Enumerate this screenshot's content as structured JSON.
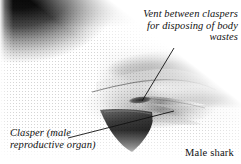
{
  "figure": {
    "subject": "Male shark",
    "medium": "black-and-white photographic illustration of the underside of a male shark showing the pelvic region",
    "background_color": "#ffffff",
    "ink_color": "#111111",
    "width": 241,
    "height": 164
  },
  "annotations": {
    "vent": {
      "text": "Vent between claspers\nfor disposing of body\nwastes",
      "lines": [
        "Vent between claspers",
        "for disposing of body",
        "wastes"
      ],
      "style": "italic",
      "align": "right",
      "leader_from": [
        174,
        48
      ],
      "leader_to": [
        142,
        101
      ]
    },
    "clasper": {
      "text": "Clasper (male\nreproductive organ)",
      "lines": [
        "Clasper (male",
        "reproductive organ)"
      ],
      "style": "italic",
      "align": "left",
      "leader_from": [
        68,
        138
      ],
      "leader_to": [
        174,
        111
      ]
    },
    "subject_label": {
      "text": "Male shark",
      "style": "roman",
      "align": "right"
    }
  },
  "image_regions": [
    {
      "name": "dorsal-surface",
      "tone": "dark",
      "position": "top-left sweeping to upper-right"
    },
    {
      "name": "ventral-belly",
      "tone": "light",
      "position": "center-left"
    },
    {
      "name": "flank-band",
      "tone": "mid-dark",
      "position": "right half"
    },
    {
      "name": "pelvic-fin",
      "tone": "dark",
      "position": "bottom-center"
    },
    {
      "name": "claspers",
      "tone": "mid",
      "position": "center-right"
    },
    {
      "name": "vent",
      "tone": "dark slit",
      "position": "center"
    }
  ]
}
